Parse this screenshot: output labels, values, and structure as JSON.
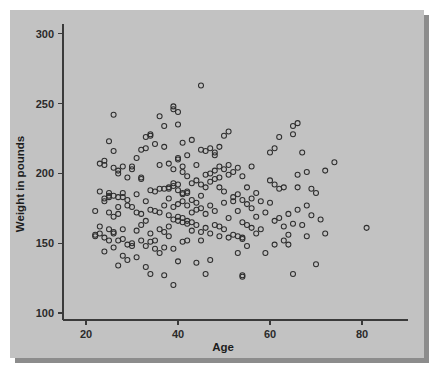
{
  "figure": {
    "background_color": "#ffffff",
    "panel_color": "#c2c2c2",
    "shadow_color": "#787878",
    "axis_color": "#3a3a3a",
    "marker_color": "#2e2e2e"
  },
  "chart_data": {
    "type": "scatter",
    "title": "",
    "xlabel": "Age",
    "ylabel": "Weight in pounds",
    "xlim": [
      15,
      90
    ],
    "ylim": [
      95,
      307
    ],
    "xticks": [
      20,
      40,
      60,
      80
    ],
    "yticks": [
      100,
      150,
      200,
      250,
      300
    ],
    "xtick_labels": [
      "20",
      "40",
      "60",
      "80"
    ],
    "ytick_labels": [
      "100",
      "150",
      "200",
      "250",
      "300"
    ],
    "grid": false,
    "legend": null,
    "marker": "open-circle",
    "marker_size": 5,
    "n_points": 216,
    "points": [
      [
        22,
        173
      ],
      [
        22,
        156
      ],
      [
        22,
        155
      ],
      [
        23,
        187
      ],
      [
        23,
        162
      ],
      [
        23,
        157
      ],
      [
        23,
        207
      ],
      [
        24,
        209
      ],
      [
        24,
        206
      ],
      [
        24,
        182
      ],
      [
        24,
        180
      ],
      [
        24,
        154
      ],
      [
        24,
        144
      ],
      [
        25,
        223
      ],
      [
        25,
        186
      ],
      [
        25,
        184
      ],
      [
        25,
        183
      ],
      [
        25,
        172
      ],
      [
        25,
        160
      ],
      [
        25,
        152
      ],
      [
        26,
        242
      ],
      [
        26,
        216
      ],
      [
        26,
        204
      ],
      [
        26,
        184
      ],
      [
        26,
        169
      ],
      [
        26,
        158
      ],
      [
        26,
        157
      ],
      [
        26,
        147
      ],
      [
        27,
        202
      ],
      [
        27,
        200
      ],
      [
        27,
        183
      ],
      [
        27,
        176
      ],
      [
        27,
        171
      ],
      [
        27,
        152
      ],
      [
        27,
        134
      ],
      [
        28,
        205
      ],
      [
        28,
        186
      ],
      [
        28,
        183
      ],
      [
        28,
        160
      ],
      [
        28,
        153
      ],
      [
        28,
        141
      ],
      [
        29,
        197
      ],
      [
        29,
        181
      ],
      [
        29,
        177
      ],
      [
        29,
        149
      ],
      [
        29,
        138
      ],
      [
        30,
        205
      ],
      [
        30,
        203
      ],
      [
        30,
        176
      ],
      [
        30,
        150
      ],
      [
        30,
        148
      ],
      [
        31,
        211
      ],
      [
        31,
        185
      ],
      [
        31,
        172
      ],
      [
        31,
        159
      ],
      [
        31,
        140
      ],
      [
        32,
        217
      ],
      [
        32,
        197
      ],
      [
        32,
        196
      ],
      [
        32,
        171
      ],
      [
        32,
        163
      ],
      [
        32,
        152
      ],
      [
        33,
        226
      ],
      [
        33,
        218
      ],
      [
        33,
        180
      ],
      [
        33,
        166
      ],
      [
        33,
        148
      ],
      [
        33,
        133
      ],
      [
        34,
        228
      ],
      [
        34,
        227
      ],
      [
        34,
        188
      ],
      [
        34,
        174
      ],
      [
        34,
        157
      ],
      [
        34,
        151
      ],
      [
        34,
        128
      ],
      [
        35,
        221
      ],
      [
        35,
        187
      ],
      [
        35,
        173
      ],
      [
        35,
        152
      ],
      [
        35,
        146
      ],
      [
        36,
        241
      ],
      [
        36,
        206
      ],
      [
        36,
        189
      ],
      [
        36,
        172
      ],
      [
        36,
        160
      ],
      [
        36,
        143
      ],
      [
        37,
        234
      ],
      [
        37,
        219
      ],
      [
        37,
        189
      ],
      [
        37,
        177
      ],
      [
        37,
        158
      ],
      [
        37,
        147
      ],
      [
        37,
        127
      ],
      [
        38,
        207
      ],
      [
        38,
        190
      ],
      [
        38,
        189
      ],
      [
        38,
        182
      ],
      [
        38,
        170
      ],
      [
        38,
        162
      ],
      [
        38,
        155
      ],
      [
        39,
        248
      ],
      [
        39,
        246
      ],
      [
        39,
        203
      ],
      [
        39,
        193
      ],
      [
        39,
        191
      ],
      [
        39,
        176
      ],
      [
        39,
        167
      ],
      [
        39,
        146
      ],
      [
        39,
        120
      ],
      [
        40,
        244
      ],
      [
        40,
        235
      ],
      [
        40,
        211
      ],
      [
        40,
        210
      ],
      [
        40,
        192
      ],
      [
        40,
        188
      ],
      [
        40,
        178
      ],
      [
        40,
        169
      ],
      [
        40,
        166
      ],
      [
        40,
        137
      ],
      [
        41,
        222
      ],
      [
        41,
        205
      ],
      [
        41,
        201
      ],
      [
        41,
        186
      ],
      [
        41,
        185
      ],
      [
        41,
        180
      ],
      [
        41,
        168
      ],
      [
        41,
        165
      ],
      [
        41,
        151
      ],
      [
        42,
        213
      ],
      [
        42,
        198
      ],
      [
        42,
        187
      ],
      [
        42,
        186
      ],
      [
        42,
        177
      ],
      [
        42,
        166
      ],
      [
        42,
        164
      ],
      [
        42,
        152
      ],
      [
        43,
        224
      ],
      [
        43,
        193
      ],
      [
        43,
        181
      ],
      [
        43,
        172
      ],
      [
        43,
        165
      ],
      [
        43,
        159
      ],
      [
        44,
        206
      ],
      [
        44,
        195
      ],
      [
        44,
        179
      ],
      [
        44,
        174
      ],
      [
        44,
        163
      ],
      [
        44,
        136
      ],
      [
        45,
        263
      ],
      [
        45,
        217
      ],
      [
        45,
        192
      ],
      [
        45,
        184
      ],
      [
        45,
        175
      ],
      [
        45,
        158
      ],
      [
        45,
        152
      ],
      [
        46,
        216
      ],
      [
        46,
        199
      ],
      [
        46,
        190
      ],
      [
        46,
        171
      ],
      [
        46,
        161
      ],
      [
        46,
        128
      ],
      [
        47,
        218
      ],
      [
        47,
        200
      ],
      [
        47,
        194
      ],
      [
        47,
        177
      ],
      [
        47,
        157
      ],
      [
        47,
        138
      ],
      [
        48,
        215
      ],
      [
        48,
        213
      ],
      [
        48,
        202
      ],
      [
        48,
        196
      ],
      [
        48,
        173
      ],
      [
        48,
        163
      ],
      [
        49,
        219
      ],
      [
        49,
        205
      ],
      [
        49,
        197
      ],
      [
        49,
        190
      ],
      [
        49,
        162
      ],
      [
        49,
        155
      ],
      [
        50,
        227
      ],
      [
        50,
        203
      ],
      [
        50,
        187
      ],
      [
        50,
        179
      ],
      [
        50,
        160
      ],
      [
        51,
        230
      ],
      [
        51,
        206
      ],
      [
        51,
        199
      ],
      [
        51,
        168
      ],
      [
        51,
        154
      ],
      [
        52,
        201
      ],
      [
        52,
        183
      ],
      [
        52,
        180
      ],
      [
        52,
        156
      ],
      [
        53,
        204
      ],
      [
        53,
        185
      ],
      [
        53,
        173
      ],
      [
        53,
        155
      ],
      [
        53,
        143
      ],
      [
        54,
        198
      ],
      [
        54,
        181
      ],
      [
        54,
        165
      ],
      [
        54,
        154
      ],
      [
        54,
        153
      ],
      [
        54,
        127
      ],
      [
        54,
        126
      ],
      [
        55,
        190
      ],
      [
        55,
        178
      ],
      [
        55,
        163
      ],
      [
        55,
        148
      ],
      [
        56,
        205
      ],
      [
        56,
        182
      ],
      [
        56,
        175
      ],
      [
        56,
        161
      ],
      [
        57,
        186
      ],
      [
        57,
        169
      ],
      [
        57,
        157
      ],
      [
        58,
        180
      ],
      [
        58,
        160
      ],
      [
        59,
        172
      ],
      [
        59,
        143
      ],
      [
        60,
        215
      ],
      [
        60,
        195
      ],
      [
        60,
        179
      ],
      [
        61,
        218
      ],
      [
        61,
        192
      ],
      [
        61,
        166
      ],
      [
        61,
        149
      ],
      [
        62,
        226
      ],
      [
        62,
        189
      ],
      [
        62,
        168
      ],
      [
        63,
        190
      ],
      [
        63,
        162
      ],
      [
        63,
        152
      ],
      [
        64,
        171
      ],
      [
        64,
        156
      ],
      [
        64,
        149
      ],
      [
        65,
        234
      ],
      [
        65,
        228
      ],
      [
        65,
        164
      ],
      [
        65,
        128
      ],
      [
        66,
        236
      ],
      [
        66,
        199
      ],
      [
        66,
        190
      ],
      [
        66,
        174
      ],
      [
        67,
        215
      ],
      [
        67,
        163
      ],
      [
        68,
        201
      ],
      [
        68,
        177
      ],
      [
        68,
        155
      ],
      [
        69,
        189
      ],
      [
        69,
        170
      ],
      [
        70,
        186
      ],
      [
        70,
        135
      ],
      [
        71,
        167
      ],
      [
        72,
        202
      ],
      [
        72,
        157
      ],
      [
        74,
        208
      ],
      [
        81,
        161
      ]
    ]
  }
}
